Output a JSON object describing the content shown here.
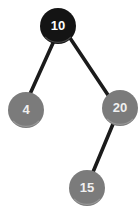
{
  "figure": {
    "name": "binary-search-tree",
    "background_color": "#ffffff",
    "width": 140,
    "height": 218
  },
  "style": {
    "root_fill": "#141414",
    "node_fill": "#7b7b7b",
    "node_fill_dark": "#6e6e6e",
    "edge_color": "#1b1b1b",
    "root_label_color": "#ffffff",
    "node_label_color": "#f0f0f0",
    "edge_width": 3.6,
    "label_font_size": 13
  },
  "nodes": [
    {
      "id": "root",
      "label": "10",
      "cx": 58,
      "cy": 26,
      "r": 18,
      "fill": "#141414",
      "text_color": "#ffffff",
      "font_size": 13,
      "role": "root"
    },
    {
      "id": "left",
      "label": "4",
      "cx": 26,
      "cy": 110,
      "r": 18,
      "fill": "#7b7b7b",
      "text_color": "#f0f0f0",
      "font_size": 13,
      "role": "leaf"
    },
    {
      "id": "right",
      "label": "20",
      "cx": 120,
      "cy": 108,
      "r": 18,
      "fill": "#7b7b7b",
      "text_color": "#f0f0f0",
      "font_size": 13,
      "role": "internal"
    },
    {
      "id": "right-left",
      "label": "15",
      "cx": 87,
      "cy": 188,
      "r": 18,
      "fill": "#7b7b7b",
      "text_color": "#f0f0f0",
      "font_size": 13,
      "role": "leaf"
    }
  ],
  "edges": [
    {
      "id": "edge-root-left",
      "from": "root",
      "to": "left",
      "x1": 53,
      "y1": 43,
      "x2": 30,
      "y2": 94
    },
    {
      "id": "edge-root-right",
      "from": "root",
      "to": "right",
      "x1": 70,
      "y1": 38,
      "x2": 110,
      "y2": 98
    },
    {
      "id": "edge-right-15",
      "from": "right",
      "to": "right-left",
      "x1": 113,
      "y1": 124,
      "x2": 93,
      "y2": 172
    }
  ]
}
